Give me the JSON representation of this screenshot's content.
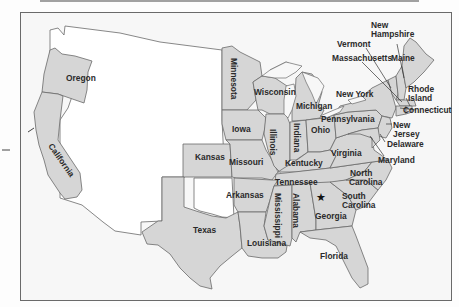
{
  "map": {
    "title": "Union and Confederate states map (partial, top cut off)",
    "fill_colors": {
      "shaded_states": "#d6d6d6",
      "unshaded_territory": "#ffffff",
      "background": "#f7f7f7",
      "border": "#6a6a6a"
    },
    "states": [
      {
        "id": "oregon",
        "label": "Oregon"
      },
      {
        "id": "california",
        "label": "California"
      },
      {
        "id": "minnesota",
        "label": "Minnesota"
      },
      {
        "id": "iowa",
        "label": "Iowa"
      },
      {
        "id": "kansas",
        "label": "Kansas"
      },
      {
        "id": "missouri",
        "label": "Missouri"
      },
      {
        "id": "wisconsin",
        "label": "Wisconsin"
      },
      {
        "id": "illinois",
        "label": "Illinois"
      },
      {
        "id": "indiana",
        "label": "Indiana"
      },
      {
        "id": "michigan",
        "label": "Michigan"
      },
      {
        "id": "ohio",
        "label": "Ohio"
      },
      {
        "id": "kentucky",
        "label": "Kentucky"
      },
      {
        "id": "tennessee",
        "label": "Tennessee"
      },
      {
        "id": "arkansas",
        "label": "Arkansas"
      },
      {
        "id": "texas",
        "label": "Texas"
      },
      {
        "id": "louisiana",
        "label": "Louisiana"
      },
      {
        "id": "mississippi",
        "label": "Mississippi"
      },
      {
        "id": "alabama",
        "label": "Alabama"
      },
      {
        "id": "georgia",
        "label": "Georgia"
      },
      {
        "id": "florida",
        "label": "Florida"
      },
      {
        "id": "south_carolina",
        "label": "South Carolina",
        "lines": [
          "South",
          "Carolina"
        ]
      },
      {
        "id": "north_carolina",
        "label": "North Carolina",
        "lines": [
          "North",
          "Carolina"
        ]
      },
      {
        "id": "virginia",
        "label": "Virginia"
      },
      {
        "id": "pennsylvania",
        "label": "Pennsylvania"
      },
      {
        "id": "new_york",
        "label": "New York"
      },
      {
        "id": "maryland",
        "label": "Maryland"
      },
      {
        "id": "delaware",
        "label": "Delaware"
      },
      {
        "id": "new_jersey",
        "label": "New Jersey",
        "lines": [
          "New",
          "Jersey"
        ]
      },
      {
        "id": "connecticut",
        "label": "Connecticut"
      },
      {
        "id": "rhode_island",
        "label": "Rhode Island",
        "lines": [
          "Rhode",
          "Island"
        ]
      },
      {
        "id": "massachusetts",
        "label": "Massachusetts"
      },
      {
        "id": "vermont",
        "label": "Vermont"
      },
      {
        "id": "new_hampshire",
        "label": "New Hampshire",
        "lines": [
          "New",
          "Hampshire"
        ]
      },
      {
        "id": "maine",
        "label": "Maine"
      }
    ],
    "markers": [
      {
        "id": "capital-star",
        "symbol": "★",
        "location": "Georgia/Alabama area"
      }
    ]
  }
}
